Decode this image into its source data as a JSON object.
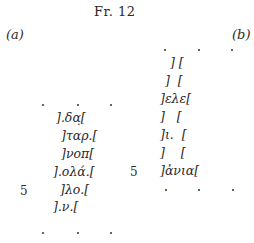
{
  "title": "Fr. 12",
  "columns": {
    "a": {
      "label": "(a)",
      "line_number": "5",
      "lines": [
        "].δα̣[",
        "]ταρ.[",
        "]νοπ[",
        "].ολά.[",
        "]λο.[",
        "].ν.["
      ]
    },
    "b": {
      "label": "(b)",
      "line_number": "5",
      "lines": [
        "] [",
        "]  [",
        "]ελε[",
        "]   [",
        "]ι.  [",
        "]    [",
        "]ἀνια["
      ]
    }
  }
}
